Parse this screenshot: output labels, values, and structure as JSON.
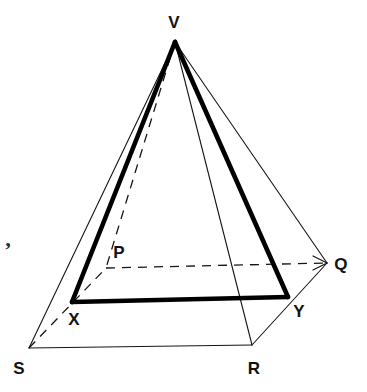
{
  "figure": {
    "width": 367,
    "height": 392,
    "background_color": "#ffffff",
    "line_color": "#151515",
    "bold_line_color": "#000000",
    "thin_stroke_width": 1.1,
    "bold_stroke_width": 4.6,
    "dash_pattern": "9 7"
  },
  "scan_artifact": {
    "glyph": "’",
    "x": 8,
    "y": 250
  },
  "points": {
    "V": {
      "label": "V",
      "x": 175,
      "y": 42,
      "label_x": 174,
      "label_y": 22
    },
    "S": {
      "label": "S",
      "x": 29,
      "y": 348,
      "label_x": 19,
      "label_y": 368
    },
    "R": {
      "label": "R",
      "x": 252,
      "y": 345,
      "label_x": 254,
      "label_y": 368
    },
    "Q": {
      "label": "Q",
      "x": 327,
      "y": 263,
      "label_x": 341,
      "label_y": 264
    },
    "P": {
      "label": "P",
      "x": 106,
      "y": 268,
      "label_x": 119,
      "label_y": 252
    },
    "X": {
      "label": "X",
      "x": 72,
      "y": 302,
      "label_x": 74,
      "label_y": 319
    },
    "Y": {
      "label": "Y",
      "x": 288,
      "y": 297,
      "label_x": 299,
      "label_y": 311
    }
  },
  "edges": [
    {
      "name": "apex-to-S",
      "from": "V",
      "to": "S",
      "style": "thin"
    },
    {
      "name": "apex-to-R",
      "from": "V",
      "to": "R",
      "style": "thin"
    },
    {
      "name": "apex-to-Q",
      "from": "V",
      "to": "Q",
      "style": "thin"
    },
    {
      "name": "apex-to-X-bold",
      "from": "V",
      "to": "X",
      "style": "bold"
    },
    {
      "name": "apex-to-Y-bold",
      "from": "V",
      "to": "Y",
      "style": "bold"
    },
    {
      "name": "apex-to-P-hidden",
      "from": "V",
      "to": "P",
      "style": "dashed"
    },
    {
      "name": "base-S-to-R",
      "from": "S",
      "to": "R",
      "style": "thin"
    },
    {
      "name": "base-R-to-Q",
      "from": "R",
      "to": "Q",
      "style": "thin"
    },
    {
      "name": "base-S-to-P-hidden",
      "from": "S",
      "to": "P",
      "style": "dashed"
    },
    {
      "name": "base-P-to-Q-hidden",
      "from": "P",
      "to": "Q",
      "style": "dashed"
    },
    {
      "name": "section-X-to-Y-bold",
      "from": "X",
      "to": "Y",
      "style": "bold"
    }
  ],
  "arrow_head": {
    "name": "arrow-at-Q",
    "tip_x": 327,
    "tip_y": 263,
    "back_x": 313,
    "back_y": 256,
    "back2_x": 313,
    "back2_y": 270
  }
}
